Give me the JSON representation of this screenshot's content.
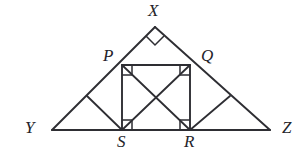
{
  "figure": {
    "background_color": "#ffffff",
    "stroke_color": "#2e2e33",
    "canvas": {
      "width": 307,
      "height": 162
    }
  },
  "labels": {
    "apex": "X",
    "square_top_left": "P",
    "square_top_right": "Q",
    "base_left": "Y",
    "base_right": "Z",
    "square_bottom_left": "S",
    "square_bottom_right": "R"
  },
  "points": {
    "X": {
      "x": 155,
      "y": 27
    },
    "Y": {
      "x": 52,
      "y": 130
    },
    "Z": {
      "x": 270,
      "y": 130
    },
    "P": {
      "x": 122,
      "y": 65
    },
    "Q": {
      "x": 190,
      "y": 65
    },
    "S": {
      "x": 122,
      "y": 130
    },
    "R": {
      "x": 190,
      "y": 130
    },
    "M_YP": {
      "x": 87,
      "y": 97
    },
    "M_QZ": {
      "x": 230,
      "y": 97
    }
  },
  "segments": [
    {
      "name": "side-YX",
      "from": "Y",
      "to": "X",
      "kind": "outer"
    },
    {
      "name": "side-XZ",
      "from": "X",
      "to": "Z",
      "kind": "outer"
    },
    {
      "name": "base-YZ",
      "from": "Y",
      "to": "Z",
      "kind": "outer"
    },
    {
      "name": "square-top-PQ",
      "from": "P",
      "to": "Q",
      "kind": "square"
    },
    {
      "name": "square-left-PS",
      "from": "P",
      "to": "S",
      "kind": "square"
    },
    {
      "name": "square-right-QR",
      "from": "Q",
      "to": "R",
      "kind": "square"
    },
    {
      "name": "square-bottom-SR",
      "from": "S",
      "to": "R",
      "kind": "square"
    },
    {
      "name": "diagonal-PR",
      "from": "P",
      "to": "R",
      "kind": "diagonal"
    },
    {
      "name": "diagonal-QS",
      "from": "Q",
      "to": "S",
      "kind": "diagonal"
    },
    {
      "name": "cevian-S-to-midYP",
      "from": "S",
      "to": "M_YP",
      "kind": "cevian"
    },
    {
      "name": "cevian-R-to-midQZ",
      "from": "R",
      "to": "M_QZ",
      "kind": "cevian"
    }
  ],
  "right_angle_markers": [
    {
      "name": "right-angle-at-X",
      "vertex": "X",
      "style": "diamond"
    },
    {
      "name": "right-angle-at-P",
      "vertex": "P",
      "style": "corner-square"
    },
    {
      "name": "right-angle-at-Q",
      "vertex": "Q",
      "style": "corner-square"
    },
    {
      "name": "right-angle-at-S",
      "vertex": "S",
      "style": "corner-square"
    },
    {
      "name": "right-angle-at-R",
      "vertex": "R",
      "style": "corner-square"
    }
  ],
  "label_positions": {
    "X": {
      "left": 148,
      "top": 2
    },
    "P": {
      "left": 103,
      "top": 47
    },
    "Q": {
      "left": 201,
      "top": 47
    },
    "Y": {
      "left": 25,
      "top": 119
    },
    "Z": {
      "left": 282,
      "top": 119
    },
    "S": {
      "left": 117,
      "top": 133
    },
    "R": {
      "left": 184,
      "top": 133
    }
  }
}
